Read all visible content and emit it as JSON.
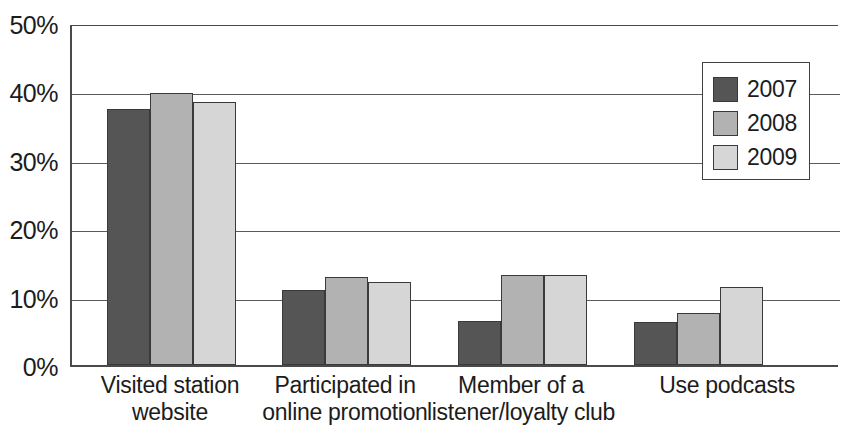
{
  "chart_data": {
    "type": "bar",
    "title": "",
    "xlabel": "",
    "ylabel": "",
    "ylim": [
      0,
      50
    ],
    "ytick_labels": [
      "50%",
      "40%",
      "30%",
      "20%",
      "10%",
      "0%"
    ],
    "ytick_values": [
      50,
      40,
      30,
      20,
      10,
      0
    ],
    "grid": true,
    "legend_position": "top-right",
    "categories": [
      "Visited station website",
      "Participated in online promotion",
      "Member of a listener/loyalty club",
      "Use podcasts"
    ],
    "category_lines": [
      [
        "Visited station",
        "website"
      ],
      [
        "Participated in",
        "online promotion"
      ],
      [
        "Member of a",
        "listener/loyalty club"
      ],
      [
        "Use podcasts",
        ""
      ]
    ],
    "series": [
      {
        "name": "2007",
        "color": "#555555",
        "values": [
          37.7,
          11.0,
          6.4,
          6.3
        ]
      },
      {
        "name": "2008",
        "color": "#b2b2b2",
        "values": [
          40.0,
          13.0,
          13.3,
          7.7
        ]
      },
      {
        "name": "2009",
        "color": "#d6d6d6",
        "values": [
          38.7,
          12.2,
          13.2,
          11.4
        ]
      }
    ]
  },
  "legend": {
    "items": [
      {
        "label": "2007"
      },
      {
        "label": "2008"
      },
      {
        "label": "2009"
      }
    ]
  },
  "axis": {
    "y": {
      "ticks": [
        {
          "label": "50%"
        },
        {
          "label": "40%"
        },
        {
          "label": "30%"
        },
        {
          "label": "20%"
        },
        {
          "label": "10%"
        },
        {
          "label": "0%"
        }
      ]
    },
    "x": {
      "categories": [
        {
          "line1": "Visited station",
          "line2": "website"
        },
        {
          "line1": "Participated in",
          "line2": "online promotion"
        },
        {
          "line1": "Member of a",
          "line2": "listener/loyalty club"
        },
        {
          "line1": "Use podcasts",
          "line2": ""
        }
      ]
    }
  }
}
